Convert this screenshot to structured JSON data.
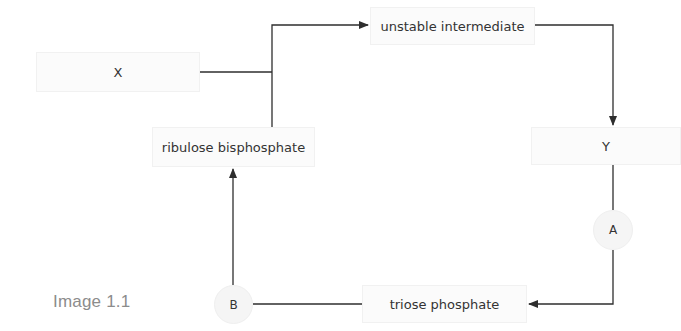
{
  "diagram": {
    "caption": "Image 1.1",
    "nodes": {
      "x": "X",
      "unstable_intermediate": "unstable intermediate",
      "y": "Y",
      "triose_phosphate": "triose phosphate",
      "ribulose_bisphosphate": "ribulose bisphosphate"
    },
    "circles": {
      "a": "A",
      "b": "B"
    },
    "edges": [
      {
        "from": "X",
        "to": "junction",
        "arrow": false
      },
      {
        "from": "ribulose bisphosphate",
        "to": "junction",
        "arrow": false
      },
      {
        "from": "junction",
        "to": "unstable intermediate",
        "arrow": true
      },
      {
        "from": "unstable intermediate",
        "to": "Y",
        "arrow": true
      },
      {
        "from": "Y",
        "to": "A",
        "arrow": false
      },
      {
        "from": "A",
        "to": "triose phosphate",
        "arrow": true
      },
      {
        "from": "triose phosphate",
        "to": "B",
        "arrow": false
      },
      {
        "from": "B",
        "to": "ribulose bisphosphate",
        "arrow": true
      }
    ],
    "colors": {
      "line": "#2e2e2e",
      "box_fill": "#fbfbfb",
      "circle_fill": "#f5f5f5",
      "caption_text": "#8c8c8c"
    }
  }
}
